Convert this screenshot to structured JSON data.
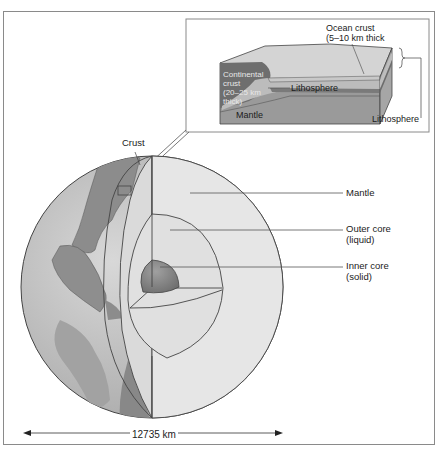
{
  "inset": {
    "ocean_crust": "Ocean crust",
    "ocean_crust_thickness": "(5–10 km thick",
    "continental_crust_l1": "Continental",
    "continental_crust_l2": "crust",
    "continental_crust_l3": "(20–25 km",
    "continental_crust_l4": "thick)",
    "lithosphere_inner": "Lithosphere",
    "mantle": "Mantle",
    "lithosphere_side": "Lithosphere"
  },
  "globe": {
    "crust": "Crust",
    "mantle": "Mantle",
    "outer_core_l1": "Outer core",
    "outer_core_l2": "(liquid)",
    "inner_core_l1": "Inner core",
    "inner_core_l2": "(solid)"
  },
  "scale": {
    "diameter": "12735 km"
  },
  "colors": {
    "ocean": "#c9c9c9",
    "land": "#8c8c8c",
    "mantle": "#e4e4e4",
    "inner_core": "#8e8e8e",
    "line": "#555555"
  }
}
